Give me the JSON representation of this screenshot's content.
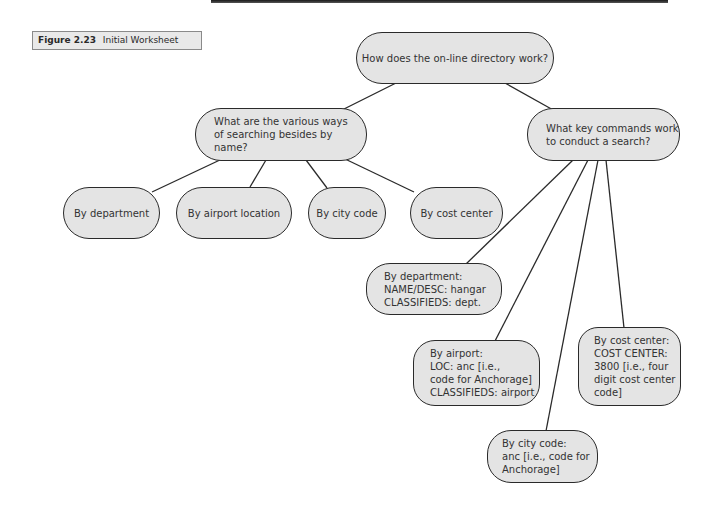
{
  "figure": {
    "number": "Figure 2.23",
    "title": "Initial Worksheet"
  },
  "nodes": {
    "root": "How does the on-line directory work?",
    "q_ways": "What are the various ways\nof searching besides by name?",
    "q_commands": "What key commands work\nto conduct a search?",
    "way_department": "By department",
    "way_airport": "By airport location",
    "way_city": "By city code",
    "way_cost": "By cost center",
    "cmd_department": "By department:\nNAME/DESC: hangar\nCLASSIFIEDS: dept.",
    "cmd_airport": "By airport:\nLOC: anc [i.e.,\ncode for Anchorage]\nCLASSIFIEDS: airport",
    "cmd_city": "By city code:\nanc [i.e., code for\nAnchorage]",
    "cmd_cost": "By cost center:\nCOST CENTER:\n3800 [i.e., four\ndigit cost center\ncode]"
  },
  "colors": {
    "node_fill": "#e4e4e4",
    "node_border": "#2a2a2a",
    "caption_fill": "#e9e9e9"
  }
}
